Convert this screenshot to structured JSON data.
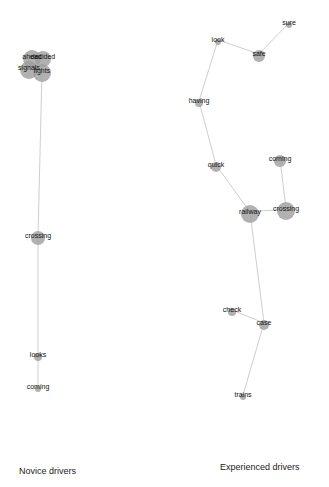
{
  "panels": [
    {
      "caption": "Novice drivers",
      "nodes": [
        {
          "id": "ahead",
          "x": 32,
          "y": 57,
          "r": 9
        },
        {
          "id": "decided",
          "x": 43,
          "y": 57,
          "r": 8
        },
        {
          "id": "signals",
          "x": 29,
          "y": 68,
          "r": 9
        },
        {
          "id": "lights",
          "x": 42,
          "y": 71,
          "r": 9
        },
        {
          "id": "crossing",
          "x": 38,
          "y": 236,
          "r": 7
        },
        {
          "id": "looks",
          "x": 38,
          "y": 355,
          "r": 4
        },
        {
          "id": "coming",
          "x": 38,
          "y": 387,
          "r": 3
        }
      ],
      "edges": [
        [
          "lights",
          "crossing"
        ],
        [
          "crossing",
          "looks"
        ],
        [
          "looks",
          "coming"
        ]
      ]
    },
    {
      "caption": "Experienced drivers",
      "nodes": [
        {
          "id": "sure",
          "x": 289,
          "y": 23,
          "r": 3
        },
        {
          "id": "look",
          "x": 218,
          "y": 40,
          "r": 3
        },
        {
          "id": "safe",
          "x": 259,
          "y": 54,
          "r": 6
        },
        {
          "id": "having",
          "x": 199,
          "y": 101,
          "r": 4
        },
        {
          "id": "quick",
          "x": 216,
          "y": 165,
          "r": 5
        },
        {
          "id": "coming",
          "x": 280,
          "y": 159,
          "r": 6
        },
        {
          "id": "railway",
          "x": 250,
          "y": 212,
          "r": 9
        },
        {
          "id": "crossing",
          "x": 286,
          "y": 209,
          "r": 9
        },
        {
          "id": "check",
          "x": 232,
          "y": 310,
          "r": 4
        },
        {
          "id": "case",
          "x": 264,
          "y": 323,
          "r": 5
        },
        {
          "id": "trains",
          "x": 243,
          "y": 395,
          "r": 3
        }
      ],
      "edges": [
        [
          "sure",
          "safe"
        ],
        [
          "safe",
          "look"
        ],
        [
          "look",
          "having"
        ],
        [
          "having",
          "quick"
        ],
        [
          "quick",
          "railway"
        ],
        [
          "railway",
          "crossing"
        ],
        [
          "coming",
          "crossing"
        ],
        [
          "railway",
          "case"
        ],
        [
          "check",
          "case"
        ],
        [
          "case",
          "trains"
        ]
      ]
    }
  ],
  "colors": {
    "node_fill": "#9e9e9e",
    "edge": "#cfcfcf",
    "label": "#111111"
  }
}
